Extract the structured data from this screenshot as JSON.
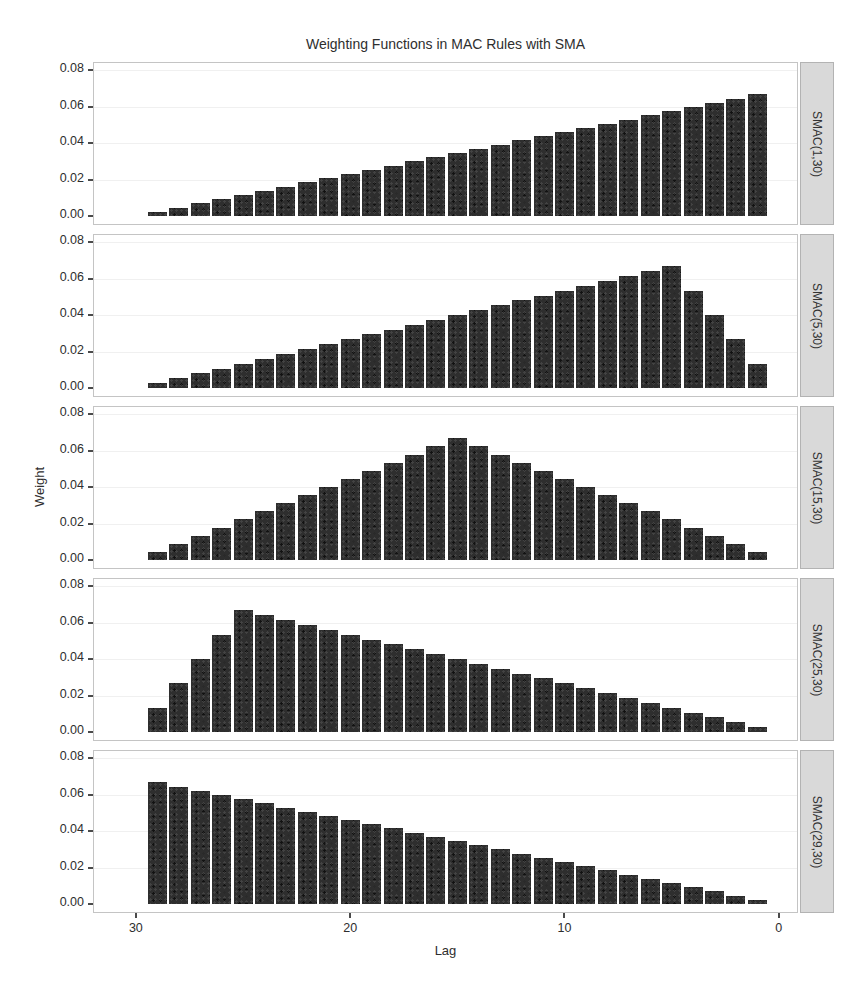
{
  "chart_data": {
    "type": "bar",
    "title": "Weighting Functions in MAC Rules with SMA",
    "xlabel": "Lag",
    "ylabel": "Weight",
    "x_reversed": true,
    "xlim": [
      32,
      -0.9
    ],
    "ylim": [
      0,
      0.08
    ],
    "grid": "very-faint-horizontal",
    "bar_color": "#2e2e2e",
    "strip_bg": "#d9d9d9",
    "x_ticks": [
      {
        "label": "30",
        "value": 30
      },
      {
        "label": "20",
        "value": 20
      },
      {
        "label": "10",
        "value": 10
      },
      {
        "label": "0",
        "value": 0
      }
    ],
    "y_ticks": [
      {
        "label": "0.08",
        "value": 0.08
      },
      {
        "label": "0.06",
        "value": 0.06
      },
      {
        "label": "0.04",
        "value": 0.04
      },
      {
        "label": "0.02",
        "value": 0.02
      },
      {
        "label": "0.00",
        "value": 0.0
      }
    ],
    "lags": [
      29,
      28,
      27,
      26,
      25,
      24,
      23,
      22,
      21,
      20,
      19,
      18,
      17,
      16,
      15,
      14,
      13,
      12,
      11,
      10,
      9,
      8,
      7,
      6,
      5,
      4,
      3,
      2,
      1
    ],
    "facets": [
      {
        "label": "SMAC(1,30)",
        "values": [
          0.0023,
          0.0046,
          0.0069,
          0.0092,
          0.01149,
          0.01379,
          0.01609,
          0.01839,
          0.02069,
          0.02299,
          0.02529,
          0.02759,
          0.02989,
          0.03218,
          0.03448,
          0.03678,
          0.03908,
          0.04138,
          0.04368,
          0.04598,
          0.04828,
          0.05057,
          0.05287,
          0.05517,
          0.05747,
          0.05977,
          0.06207,
          0.06437,
          0.06667
        ]
      },
      {
        "label": "SMAC(5,30)",
        "values": [
          0.00267,
          0.00533,
          0.008,
          0.01067,
          0.01333,
          0.016,
          0.01867,
          0.02133,
          0.024,
          0.02667,
          0.02933,
          0.032,
          0.03467,
          0.03733,
          0.04,
          0.04267,
          0.04533,
          0.048,
          0.05067,
          0.05333,
          0.056,
          0.05867,
          0.06133,
          0.064,
          0.06667,
          0.05333,
          0.04,
          0.02667,
          0.01333
        ]
      },
      {
        "label": "SMAC(15,30)",
        "values": [
          0.00444,
          0.00889,
          0.01333,
          0.01778,
          0.02222,
          0.02667,
          0.03111,
          0.03556,
          0.04,
          0.04444,
          0.04889,
          0.05333,
          0.05778,
          0.06222,
          0.06667,
          0.06222,
          0.05778,
          0.05333,
          0.04889,
          0.04444,
          0.04,
          0.03556,
          0.03111,
          0.02667,
          0.02222,
          0.01778,
          0.01333,
          0.00889,
          0.00444
        ]
      },
      {
        "label": "SMAC(25,30)",
        "values": [
          0.01333,
          0.02667,
          0.04,
          0.05333,
          0.06667,
          0.064,
          0.06133,
          0.05867,
          0.056,
          0.05333,
          0.05067,
          0.048,
          0.04533,
          0.04267,
          0.04,
          0.03733,
          0.03467,
          0.032,
          0.02933,
          0.02667,
          0.024,
          0.02133,
          0.01867,
          0.016,
          0.01333,
          0.01067,
          0.008,
          0.00533,
          0.00267
        ]
      },
      {
        "label": "SMAC(29,30)",
        "values": [
          0.06667,
          0.06437,
          0.06207,
          0.05977,
          0.05747,
          0.05517,
          0.05287,
          0.05057,
          0.04828,
          0.04598,
          0.04368,
          0.04138,
          0.03908,
          0.03678,
          0.03448,
          0.03218,
          0.02989,
          0.02759,
          0.02529,
          0.02299,
          0.02069,
          0.01839,
          0.01609,
          0.01379,
          0.01149,
          0.0092,
          0.0069,
          0.0046,
          0.0023
        ]
      }
    ]
  }
}
